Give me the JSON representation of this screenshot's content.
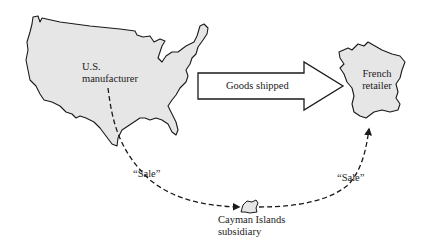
{
  "diagram": {
    "colors": {
      "land_fill": "#e6e6e6",
      "outline": "#1a1a1a",
      "background": "#ffffff"
    },
    "nodes": {
      "us": {
        "line1": "U.S.",
        "line2": "manufacturer"
      },
      "france": {
        "line1": "French",
        "line2": "retailer"
      },
      "cayman": {
        "line1": "Cayman Islands",
        "line2": "subsidiary"
      }
    },
    "edges": {
      "goods": {
        "label": "Goods shipped",
        "from": "us",
        "to": "france",
        "style": "block-arrow"
      },
      "sale_1": {
        "label": "“Sale”",
        "from": "us",
        "to": "cayman",
        "style": "dashed"
      },
      "sale_2": {
        "label": "“Sale”",
        "from": "cayman",
        "to": "france",
        "style": "dashed"
      }
    }
  }
}
